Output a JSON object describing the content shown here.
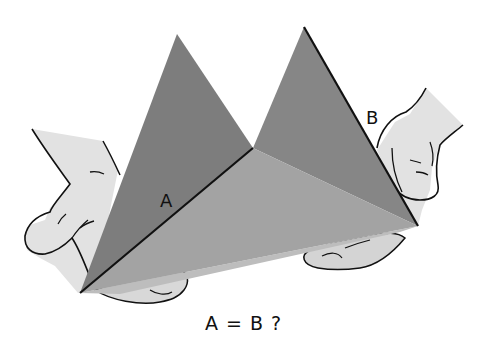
{
  "figure": {
    "edge_labels": {
      "a": "A",
      "b": "B"
    },
    "caption": "A = B ?",
    "colors": {
      "background": "#ffffff",
      "left_face": "#7f7f7f",
      "right_face": "#8a8a8a",
      "bottom_face": "#a6a6a6",
      "underside": "#bdbdbd",
      "hand_fill": "#e2e2e2",
      "outline": "#111111"
    }
  }
}
